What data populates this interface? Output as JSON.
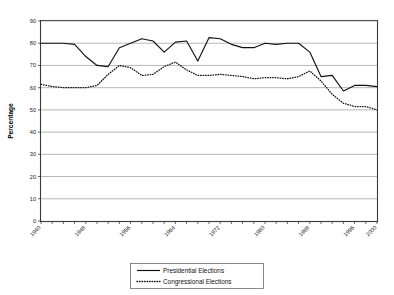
{
  "chart_data": {
    "type": "line",
    "title": "",
    "xlabel": "",
    "ylabel": "Percentage",
    "ylim": [
      0,
      90
    ],
    "ytick_step": 10,
    "yticks": [
      0,
      10,
      20,
      30,
      40,
      50,
      60,
      70,
      80,
      90
    ],
    "grid": true,
    "legend_position": "bottom-center",
    "x": [
      1940,
      1942,
      1944,
      1946,
      1948,
      1950,
      1952,
      1954,
      1956,
      1958,
      1960,
      1962,
      1964,
      1966,
      1968,
      1970,
      1972,
      1974,
      1976,
      1978,
      1980,
      1982,
      1984,
      1986,
      1988,
      1990,
      1992,
      1994,
      1996,
      1998,
      2000
    ],
    "xtick_labels": [
      "1940",
      "1946",
      "1956",
      "1964",
      "1972",
      "1980",
      "1986",
      "1988",
      "1964",
      "1972",
      "1980",
      "1986",
      "1988",
      "1964",
      "1972",
      "1980",
      "1992",
      "2000"
    ],
    "xtick_labels_shown": [
      "1940",
      "1948",
      "1956",
      "1964",
      "1972",
      "1980",
      "1988",
      "1996",
      "2000"
    ],
    "xtick_labels_rendered": [
      "1940",
      "1948",
      "1956",
      "1964",
      "1972",
      "1980",
      "1986",
      "1988",
      "1994",
      "1912",
      "1920",
      "1926",
      "1934",
      "1992",
      "1980",
      "1979",
      "1984",
      "1992",
      "2000"
    ],
    "xtick_labels_final": [
      "1940",
      "1948",
      "1956",
      "1964",
      "1972",
      "1980",
      "1988",
      "1996",
      "2000"
    ],
    "series": [
      {
        "name": "Presidential Elections",
        "style": "solid",
        "color": "#111111",
        "values": [
          80,
          80,
          80,
          79.5,
          74,
          70,
          69.5,
          78,
          80,
          82,
          81,
          76,
          80.5,
          81,
          72,
          82.5,
          82,
          79.5,
          78,
          78,
          80,
          79.5,
          80,
          80,
          76,
          65,
          65.5,
          58.5,
          61,
          61,
          60.5
        ]
      },
      {
        "name": "Congressional Elections",
        "style": "dotted",
        "color": "#111111",
        "values": [
          61.5,
          60.5,
          60,
          60,
          60,
          61,
          66,
          70,
          69,
          65.5,
          66,
          69.5,
          71.5,
          68,
          65.5,
          65.5,
          66,
          65.5,
          65,
          64,
          64.5,
          64.5,
          64,
          65,
          67.5,
          63,
          57,
          53,
          51.5,
          51.5,
          50
        ]
      }
    ],
    "legend": [
      {
        "label": "Presidential Elections",
        "style": "solid"
      },
      {
        "label": "Congressional Elections",
        "style": "dotted"
      }
    ]
  },
  "chart_series_full": {
    "x_index_count": 31,
    "presidential": [
      80,
      80,
      80,
      79.5,
      74,
      70,
      69.5,
      78,
      80,
      82,
      81,
      76,
      80.5,
      81,
      72,
      82.5,
      82,
      79.5,
      78,
      78,
      80,
      79.5,
      80,
      80,
      76,
      65,
      65.5,
      58.5,
      61,
      61,
      60.5
    ],
    "congressional": [
      61.5,
      60.5,
      60,
      60,
      60,
      61,
      66,
      70,
      69,
      65.5,
      66,
      69.5,
      71.5,
      68,
      65.5,
      65.5,
      66,
      65.5,
      65,
      64,
      64.5,
      64.5,
      64,
      65,
      67.5,
      63,
      57,
      53,
      51.5,
      51.5,
      50
    ]
  },
  "axis": {
    "y_title": "Percentage",
    "y_tick_labels": [
      "90",
      "80",
      "70",
      "60",
      "50",
      "40",
      "30",
      "20",
      "10",
      "0"
    ],
    "x_tick_labels": [
      "1940",
      "1948",
      "1956",
      "1964",
      "1972",
      "1980",
      "1988",
      "1996",
      "2000"
    ]
  },
  "legend": {
    "items": [
      {
        "label": "Presidential Elections"
      },
      {
        "label": "Congressional Elections"
      }
    ]
  }
}
